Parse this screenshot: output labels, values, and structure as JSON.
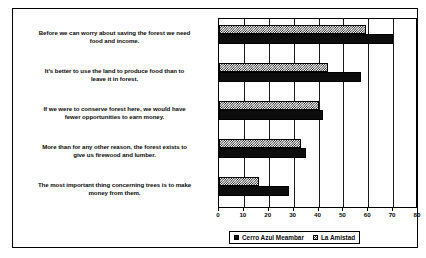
{
  "figure": {
    "background_color": "#ffffff",
    "frame_color": "#000000"
  },
  "legend": {
    "position": "bottom-center",
    "entries": [
      {
        "label": "Cerro Azul Meambar",
        "marker": "solid-square-swatch",
        "fill": "solid",
        "color": "#0d0d0d"
      },
      {
        "label": "La Amistad",
        "marker": "hatched-square-swatch",
        "fill": "hatch",
        "color": "#111111"
      }
    ]
  },
  "axis": {
    "ticks": [
      "0",
      "10",
      "20",
      "30",
      "40",
      "50",
      "60",
      "70",
      "80"
    ],
    "min": 0,
    "max": 80,
    "step": 10
  },
  "categories": [
    {
      "lines": [
        "Before we can worry about saving the forest we need",
        "food and income."
      ]
    },
    {
      "lines": [
        "It's better to use the land to produce food than to",
        "leave it in forest."
      ]
    },
    {
      "lines": [
        "If we were to conserve forest here, we would have",
        "fewer opportunities to earn money."
      ]
    },
    {
      "lines": [
        "More than for any other reason, the forest exists to",
        "give us firewood and lumber."
      ]
    },
    {
      "lines": [
        "The most important thing concerning trees is to make",
        "money from them."
      ]
    }
  ],
  "chart_data": {
    "type": "bar",
    "orientation": "horizontal",
    "title": "",
    "subtitle": "",
    "xlabel": "",
    "ylabel": "",
    "xlim": [
      0,
      80
    ],
    "grid": true,
    "grid_axis": "x",
    "legend_position": "bottom-center",
    "categories": [
      "Before we can worry about saving the forest we need food and income.",
      "It's better to use the land to produce food than to leave it in forest.",
      "If we were to conserve forest here, we would have fewer opportunities to earn money.",
      "More than for any other reason, the forest exists to give us firewood and lumber.",
      "The most important thing concerning trees is to make money from them."
    ],
    "series": [
      {
        "name": "Cerro Azul Meambar",
        "fill": "solid",
        "color": "#0d0d0d",
        "values": [
          70,
          57,
          42,
          35,
          28
        ]
      },
      {
        "name": "La Amistad",
        "fill": "hatch",
        "color": "#111111",
        "values": [
          59,
          44,
          40,
          33,
          16
        ]
      }
    ]
  }
}
